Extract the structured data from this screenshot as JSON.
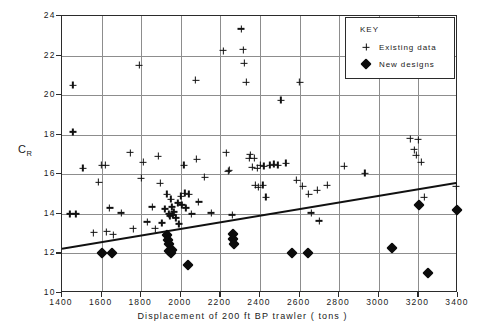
{
  "chart_data": {
    "type": "scatter",
    "title": "",
    "xlabel": "Displacement of 200 ft  BP trawler ( tons )",
    "ylabel": "C",
    "ylabel_sub": "R",
    "xlim": [
      1400,
      3400
    ],
    "ylim": [
      10,
      24
    ],
    "xticks": [
      1400,
      1600,
      1800,
      2000,
      2200,
      2400,
      2600,
      2800,
      3000,
      3200,
      3400
    ],
    "yticks": [
      10,
      12,
      14,
      16,
      18,
      20,
      22,
      24
    ],
    "grid": true,
    "legend_position": "top-right",
    "legend": {
      "title": "KEY",
      "entries": [
        {
          "symbol": "plus",
          "label": "Existing data"
        },
        {
          "symbol": "diamond",
          "label": "New designs"
        }
      ]
    },
    "series": [
      {
        "name": "Existing data",
        "marker": "plus",
        "color": "#111111",
        "points": [
          [
            1455,
            20.5
          ],
          [
            1455,
            18.15
          ],
          [
            1440,
            14.0
          ],
          [
            1470,
            14.0
          ],
          [
            1505,
            16.3
          ],
          [
            1560,
            13.05
          ],
          [
            1585,
            15.6
          ],
          [
            1600,
            16.45
          ],
          [
            1620,
            16.45
          ],
          [
            1625,
            13.1
          ],
          [
            1640,
            14.3
          ],
          [
            1660,
            12.95
          ],
          [
            1700,
            14.05
          ],
          [
            1745,
            17.1
          ],
          [
            1760,
            13.25
          ],
          [
            1790,
            21.5
          ],
          [
            1800,
            15.8
          ],
          [
            1810,
            16.6
          ],
          [
            1830,
            13.6
          ],
          [
            1855,
            14.35
          ],
          [
            1870,
            13.25
          ],
          [
            1885,
            16.9
          ],
          [
            1895,
            15.55
          ],
          [
            1905,
            13.55
          ],
          [
            1920,
            14.25
          ],
          [
            1930,
            15.0
          ],
          [
            1940,
            14.0
          ],
          [
            1945,
            13.9
          ],
          [
            1950,
            14.75
          ],
          [
            1955,
            14.35
          ],
          [
            1960,
            13.95
          ],
          [
            1965,
            14.1
          ],
          [
            1975,
            13.8
          ],
          [
            1985,
            14.55
          ],
          [
            1990,
            13.5
          ],
          [
            2000,
            14.9
          ],
          [
            2005,
            14.45
          ],
          [
            2015,
            16.45
          ],
          [
            2020,
            15.05
          ],
          [
            2025,
            14.3
          ],
          [
            2040,
            15.0
          ],
          [
            2055,
            14.0
          ],
          [
            2075,
            20.75
          ],
          [
            2080,
            16.75
          ],
          [
            2090,
            14.6
          ],
          [
            2120,
            15.85
          ],
          [
            2155,
            14.05
          ],
          [
            2215,
            22.25
          ],
          [
            2230,
            17.1
          ],
          [
            2240,
            16.15
          ],
          [
            2245,
            16.2
          ],
          [
            2260,
            13.95
          ],
          [
            2305,
            23.35
          ],
          [
            2315,
            22.3
          ],
          [
            2320,
            21.6
          ],
          [
            2330,
            20.65
          ],
          [
            2345,
            16.8
          ],
          [
            2350,
            17.0
          ],
          [
            2360,
            16.35
          ],
          [
            2370,
            16.8
          ],
          [
            2375,
            15.45
          ],
          [
            2385,
            16.3
          ],
          [
            2390,
            15.35
          ],
          [
            2400,
            16.45
          ],
          [
            2415,
            15.45
          ],
          [
            2420,
            16.4
          ],
          [
            2430,
            14.85
          ],
          [
            2450,
            16.45
          ],
          [
            2470,
            16.5
          ],
          [
            2490,
            16.45
          ],
          [
            2505,
            19.75
          ],
          [
            2530,
            16.55
          ],
          [
            2585,
            15.7
          ],
          [
            2600,
            20.65
          ],
          [
            2615,
            15.4
          ],
          [
            2645,
            15.0
          ],
          [
            2660,
            14.05
          ],
          [
            2690,
            15.2
          ],
          [
            2700,
            13.65
          ],
          [
            2740,
            15.45
          ],
          [
            2825,
            16.4
          ],
          [
            2930,
            16.05
          ],
          [
            3160,
            17.8
          ],
          [
            3180,
            17.25
          ],
          [
            3190,
            16.95
          ],
          [
            3200,
            17.75
          ],
          [
            3215,
            16.6
          ],
          [
            3230,
            14.85
          ],
          [
            3390,
            15.4
          ]
        ]
      },
      {
        "name": "New designs",
        "marker": "diamond",
        "color": "#0c0c0c",
        "points": [
          [
            1600,
            12.0
          ],
          [
            1650,
            12.0
          ],
          [
            1930,
            12.95
          ],
          [
            1935,
            12.7
          ],
          [
            1940,
            12.5
          ],
          [
            1940,
            12.1
          ],
          [
            1950,
            12.0
          ],
          [
            1955,
            12.15
          ],
          [
            2035,
            11.4
          ],
          [
            2265,
            13.0
          ],
          [
            2265,
            12.75
          ],
          [
            2270,
            12.5
          ],
          [
            2560,
            12.0
          ],
          [
            2640,
            12.0
          ],
          [
            3065,
            12.25
          ],
          [
            3205,
            14.45
          ],
          [
            3395,
            14.2
          ],
          [
            3250,
            11.0
          ]
        ]
      }
    ],
    "trend_line": {
      "name": "Regression line",
      "color": "#111111",
      "from": [
        1400,
        12.15
      ],
      "to": [
        3400,
        15.5
      ]
    }
  }
}
